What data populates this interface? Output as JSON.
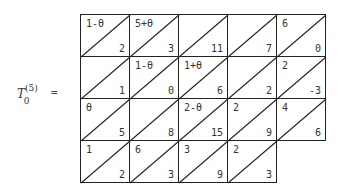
{
  "label": {
    "base": "T",
    "sup": "(5)",
    "sub": "0",
    "equals": "="
  },
  "grid": {
    "rows": [
      [
        {
          "top": "1-θ",
          "bottom": "2"
        },
        {
          "top": "5+θ",
          "bottom": "3"
        },
        {
          "top": "",
          "bottom": "11"
        },
        {
          "top": "",
          "bottom": "7"
        },
        {
          "top": "6",
          "bottom": "0"
        }
      ],
      [
        {
          "top": "",
          "bottom": "1"
        },
        {
          "top": "1-θ",
          "bottom": "0"
        },
        {
          "top": "1+θ",
          "bottom": "6"
        },
        {
          "top": "",
          "bottom": "2"
        },
        {
          "top": "2",
          "bottom": "-3"
        }
      ],
      [
        {
          "top": "θ",
          "bottom": "5"
        },
        {
          "top": "",
          "bottom": "8"
        },
        {
          "top": "2-θ",
          "bottom": "15"
        },
        {
          "top": "2",
          "bottom": "9"
        },
        {
          "top": "4",
          "bottom": "6"
        }
      ],
      [
        {
          "top": "1",
          "bottom": "2"
        },
        {
          "top": "6",
          "bottom": "3"
        },
        {
          "top": "3",
          "bottom": "9"
        },
        {
          "top": "2",
          "bottom": "3"
        }
      ]
    ]
  }
}
